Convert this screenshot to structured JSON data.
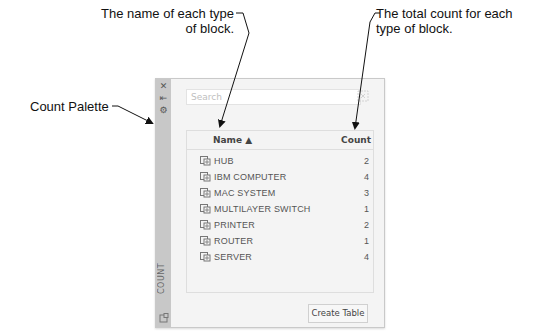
{
  "callouts": {
    "name": "The name of each type of block.",
    "count": "The total count for each type of block.",
    "palette": "Count Palette"
  },
  "palette": {
    "title": "COUNT",
    "title_icons": [
      "close-icon",
      "auto-hide-icon",
      "properties-icon"
    ],
    "search": {
      "placeholder": "Search",
      "value": ""
    },
    "columns": {
      "name": "Name ▲",
      "count": "Count"
    },
    "rows": [
      {
        "name": "HUB",
        "count": "2"
      },
      {
        "name": "IBM COMPUTER",
        "count": "4"
      },
      {
        "name": "MAC SYSTEM",
        "count": "3"
      },
      {
        "name": "MULTILAYER SWITCH",
        "count": "1"
      },
      {
        "name": "PRINTER",
        "count": "2"
      },
      {
        "name": "ROUTER",
        "count": "1"
      },
      {
        "name": "SERVER",
        "count": "4"
      }
    ],
    "create_table_label": "Create Table"
  }
}
